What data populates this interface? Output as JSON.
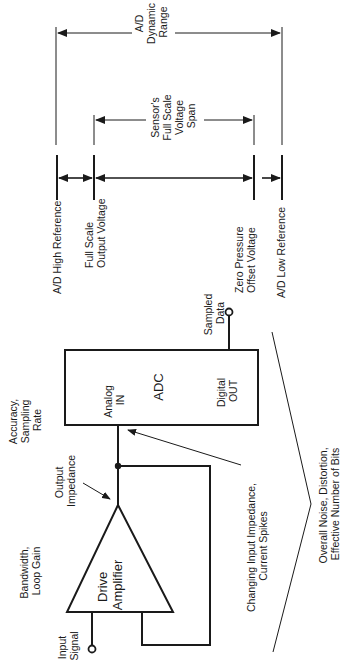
{
  "diagram": {
    "colors": {
      "ink": "#1a1a1a",
      "background": "#ffffff"
    },
    "dimension_labels": {
      "ad_dynamic_range": [
        "A/D",
        "Dynamic",
        "Range"
      ],
      "sensor_span": [
        "Sensor's",
        "Full Scale",
        "Voltage",
        "Span"
      ]
    },
    "reference_labels": {
      "ad_high_reference": [
        "A/D High Reference"
      ],
      "full_scale_output": [
        "Full Scale",
        "Output Voltage"
      ],
      "zero_pressure_offset": [
        "Zero Pressure",
        "Offset Voltage"
      ],
      "ad_low_reference": [
        "A/D Low Reference"
      ]
    },
    "blocks": {
      "adc": {
        "name": "ADC",
        "input": [
          "Analog",
          "IN"
        ],
        "output": [
          "Digital",
          "OUT"
        ]
      },
      "amplifier": {
        "name": [
          "Drive",
          "Amplifier"
        ]
      }
    },
    "annotations": {
      "accuracy": [
        "Accuracy,",
        "Sampling",
        "Rate"
      ],
      "bandwidth": [
        "Bandwidth,",
        "Loop Gain"
      ],
      "output_impedance": [
        "Output",
        "Impedance"
      ],
      "input_signal": [
        "Input",
        "Signal"
      ],
      "sampled_data": [
        "Sampled",
        "Data"
      ],
      "changing_impedance": [
        "Changing Input Impedance,",
        "Current Spikes"
      ],
      "overall_noise": [
        "Overall Noise, Distortion,",
        "Effective Number of Bits"
      ]
    }
  }
}
